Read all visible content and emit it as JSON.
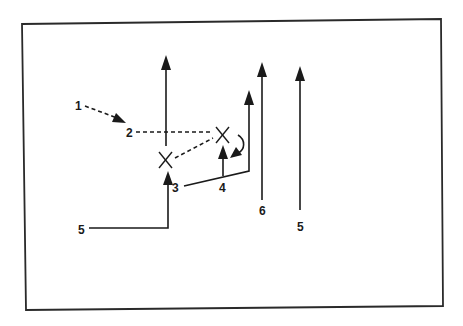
{
  "diagram": {
    "title": "",
    "colors": {
      "ink": "#1a1a1a",
      "frame": "#2a2a2a",
      "background": "#ffffff"
    },
    "defenders": [
      {
        "id": "defender-left",
        "symbol": "X"
      },
      {
        "id": "defender-right",
        "symbol": "X"
      }
    ],
    "labels": [
      {
        "id": "label-1",
        "text": "1"
      },
      {
        "id": "label-2",
        "text": "2"
      },
      {
        "id": "label-3",
        "text": "3"
      },
      {
        "id": "label-4",
        "text": "4"
      },
      {
        "id": "label-5-left",
        "text": "5"
      },
      {
        "id": "label-6",
        "text": "6"
      },
      {
        "id": "label-5-right",
        "text": "5"
      }
    ],
    "routes": [
      {
        "id": "route-1-to-2",
        "style": "dashed",
        "from": "1",
        "to": "2",
        "arrow": true
      },
      {
        "id": "route-2-to-right-x",
        "style": "dashed",
        "from": "2",
        "to": "X (right)",
        "arrow": false
      },
      {
        "id": "route-left-x-to-right-x",
        "style": "dashed",
        "from": "X (left)",
        "to": "X (right)",
        "arrow": false
      },
      {
        "id": "route-left-x-vertical",
        "style": "solid",
        "from": "X (left)",
        "to": "upfield",
        "arrow": true
      },
      {
        "id": "route-5-to-3",
        "style": "solid",
        "from": "5",
        "to": "3",
        "arrow": true
      },
      {
        "id": "route-3-corner-up",
        "style": "solid",
        "from": "3",
        "to": "upfield",
        "arrow": true
      },
      {
        "id": "route-4-up",
        "style": "solid",
        "from": "4",
        "to": "X (right)",
        "arrow": true
      },
      {
        "id": "route-curl",
        "style": "solid-curved",
        "from": "X (right)",
        "to": "down-left",
        "arrow": true
      },
      {
        "id": "route-6-up",
        "style": "solid",
        "from": "6",
        "to": "upfield",
        "arrow": true
      },
      {
        "id": "route-5-right-up",
        "style": "solid",
        "from": "5",
        "to": "upfield",
        "arrow": true
      }
    ]
  }
}
